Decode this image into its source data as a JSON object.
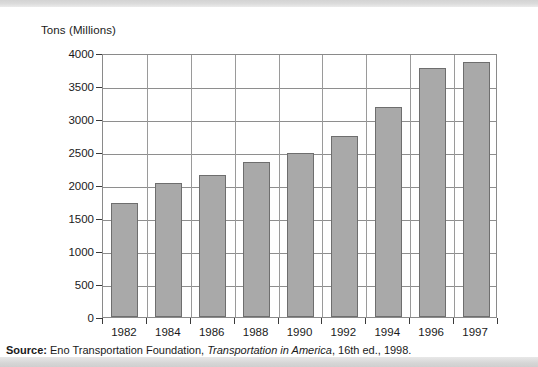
{
  "chart_data": {
    "type": "bar",
    "title": "",
    "ylabel": "Tons (Millions)",
    "xlabel": "",
    "categories": [
      "1982",
      "1984",
      "1986",
      "1988",
      "1990",
      "1992",
      "1994",
      "1996",
      "1997"
    ],
    "values": [
      1730,
      2030,
      2150,
      2350,
      2490,
      2740,
      3180,
      3780,
      3870
    ],
    "ylim": [
      0,
      4000
    ],
    "ytick_step": 500,
    "yticks": [
      "0",
      "500",
      "1000",
      "1500",
      "2000",
      "2500",
      "3000",
      "3500",
      "4000"
    ],
    "grid": "horizontal-and-vertical",
    "legend": "none",
    "bar_color": "#a9a9a9",
    "bar_border_color": "#6e6e6e",
    "axis_color": "#8a8a8a",
    "grid_color": "#8e8e8e"
  },
  "source": {
    "label": "Source:",
    "publisher": " Eno Transportation Foundation, ",
    "work": "Transportation in America",
    "edition": ", 16th ed., 1998."
  }
}
